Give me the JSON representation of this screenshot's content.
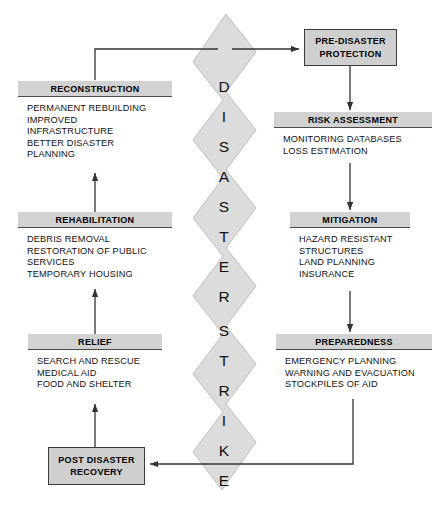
{
  "diagram": {
    "bolt": {
      "label": "DISASTER STRIKE",
      "letters": [
        "D",
        "I",
        "S",
        "A",
        "S",
        "T",
        "E",
        "R",
        "S",
        "T",
        "R",
        "I",
        "K",
        "E"
      ],
      "fill": "#dcdcdc",
      "stroke": "#b4b4b4"
    },
    "colors": {
      "header_fill": "#d2d2d2",
      "box_fill": "#ffffff",
      "solid_fill": "#cfcfcf",
      "line": "#333333",
      "border": "#4a4a4a"
    },
    "nodes": [
      {
        "id": "pre-disaster-protection",
        "type": "solid",
        "title": "PRE-DISASTER PROTECTION",
        "title_lines": [
          "PRE-DISASTER",
          "PROTECTION"
        ],
        "items": []
      },
      {
        "id": "risk-assessment",
        "type": "panel",
        "title": "RISK ASSESSMENT",
        "items": [
          "MONITORING DATABASES",
          "LOSS ESTIMATION"
        ]
      },
      {
        "id": "mitigation",
        "type": "panel",
        "title": "MITIGATION",
        "items": [
          "HAZARD RESISTANT",
          "STRUCTURES",
          "LAND PLANNING",
          "INSURANCE"
        ]
      },
      {
        "id": "preparedness",
        "type": "panel",
        "title": "PREPAREDNESS",
        "items": [
          "EMERGENCY PLANNING",
          "WARNING AND EVACUATION",
          "STOCKPILES OF AID"
        ]
      },
      {
        "id": "post-disaster-recovery",
        "type": "solid",
        "title": "POST DISASTER RECOVERY",
        "title_lines": [
          "POST DISASTER",
          "RECOVERY"
        ],
        "items": []
      },
      {
        "id": "relief",
        "type": "panel",
        "title": "RELIEF",
        "items": [
          "SEARCH AND RESCUE",
          "MEDICAL AID",
          "FOOD AND SHELTER"
        ]
      },
      {
        "id": "rehabilitation",
        "type": "panel",
        "title": "REHABILITATION",
        "items": [
          "DEBRIS REMOVAL",
          "RESTORATION OF PUBLIC",
          "SERVICES",
          "TEMPORARY HOUSING"
        ]
      },
      {
        "id": "reconstruction",
        "type": "panel",
        "title": "RECONSTRUCTION",
        "items": [
          "PERMANENT REBUILDING",
          "IMPROVED",
          "INFRASTRUCTURE",
          "BETTER DISASTER",
          "PLANNING"
        ]
      }
    ]
  }
}
